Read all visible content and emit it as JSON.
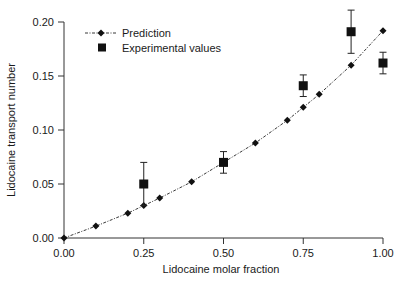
{
  "chart_data": {
    "type": "scatter",
    "title": "",
    "xlabel": "Lidocaine molar fraction",
    "ylabel": "Lidocaine transport number",
    "xlim": [
      0.0,
      1.0
    ],
    "ylim": [
      0.0,
      0.2
    ],
    "xticks": [
      "0.00",
      "0.25",
      "0.50",
      "0.75",
      "1.00"
    ],
    "yticks": [
      "0.00",
      "0.05",
      "0.10",
      "0.15",
      "0.20"
    ],
    "grid": false,
    "legend_position": "upper left",
    "series": [
      {
        "name": "Prediction",
        "style": "dash-dot line with diamond markers",
        "x": [
          0.0,
          0.1,
          0.2,
          0.25,
          0.3,
          0.4,
          0.5,
          0.6,
          0.7,
          0.75,
          0.8,
          0.9,
          1.0
        ],
        "y": [
          0.0,
          0.011,
          0.023,
          0.03,
          0.037,
          0.052,
          0.07,
          0.088,
          0.109,
          0.121,
          0.133,
          0.16,
          0.192
        ]
      },
      {
        "name": "Experimental values",
        "style": "square markers with error bars",
        "x": [
          0.25,
          0.5,
          0.75,
          0.9,
          1.0
        ],
        "y": [
          0.05,
          0.07,
          0.141,
          0.191,
          0.162
        ],
        "error": [
          0.02,
          0.01,
          0.01,
          0.02,
          0.01
        ]
      }
    ]
  },
  "legend": {
    "prediction": "Prediction",
    "experimental": "Experimental values"
  },
  "axes": {
    "xlabel": "Lidocaine molar fraction",
    "ylabel": "Lidocaine transport number"
  }
}
